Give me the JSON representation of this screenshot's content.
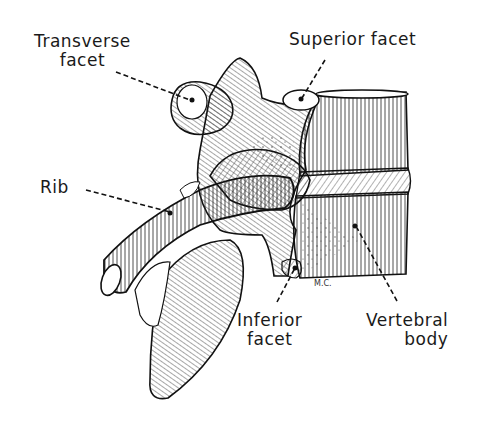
{
  "figure": {
    "labels": {
      "transverse_facet": [
        "Transverse",
        "facet"
      ],
      "superior_facet": "Superior facet",
      "rib": "Rib",
      "inferior_facet": [
        "Inferior",
        "facet"
      ],
      "vertebral_body": [
        "Vertebral",
        "body"
      ]
    },
    "signature": "M.C.",
    "colors": {
      "ink": "#1a1a1a",
      "background": "#ffffff"
    }
  }
}
